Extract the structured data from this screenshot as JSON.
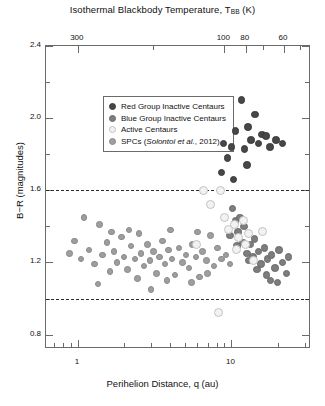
{
  "chart_data": {
    "type": "scatter",
    "title_main": "Isothermal Blackbody Temperature, T",
    "title_sub": "BB",
    "title_unit": " (K)",
    "xlabel": "Perihelion Distance, q (au)",
    "ylabel": "B−R (magnitudes)",
    "xscale": "log",
    "xlim": [
      0.62,
      33.0
    ],
    "ylim": [
      0.72,
      2.4
    ],
    "grid": false,
    "legend_position": "top-left-inside",
    "x_ticks": [
      {
        "value": 1,
        "label": "1"
      },
      {
        "value": 10,
        "label": "10"
      }
    ],
    "y_ticks": [
      {
        "value": 0.8,
        "label": "0.8"
      },
      {
        "value": 1.2,
        "label": "1.2"
      },
      {
        "value": 1.6,
        "label": "1.6"
      },
      {
        "value": 2.0,
        "label": "2.0"
      },
      {
        "value": 2.4,
        "label": "2.4"
      }
    ],
    "y_minor_ticks": [
      1.0,
      1.4,
      1.8,
      2.2
    ],
    "top_axis": {
      "label": "Isothermal Blackbody Temperature, T_BB (K)",
      "ticks": [
        {
          "q": 1.0,
          "label": "300"
        },
        {
          "q": 3.1,
          "label": ""
        },
        {
          "q": 9.0,
          "label": "100"
        },
        {
          "q": 12.4,
          "label": "80"
        },
        {
          "q": 16.0,
          "label": ""
        },
        {
          "q": 22.0,
          "label": "60"
        },
        {
          "q": 28.0,
          "label": ""
        }
      ]
    },
    "reference_lines": [
      {
        "y": 1.6,
        "style": "dashed",
        "color": "#2b2b2b"
      },
      {
        "y": 1.0,
        "style": "dashed",
        "color": "#2b2b2b"
      }
    ],
    "legend": [
      {
        "label": "Red Group Inactive Centaurs",
        "color": "#474747",
        "series": "red_group"
      },
      {
        "label": "Blue Group Inactive Centaurs",
        "color": "#7d7d7d",
        "series": "blue_group"
      },
      {
        "label": "Active Centaurs",
        "color": "#f2f2f2",
        "series": "active"
      },
      {
        "label_prefix": "SPCs (",
        "label_italic": "Solontoi et al.",
        "label_suffix": ", 2012)",
        "label": "SPCs (Solontoi et al., 2012)",
        "color": "#9e9e9e",
        "series": "spc"
      }
    ],
    "series": [
      {
        "name": "Red Group Inactive Centaurs",
        "color": "#474747",
        "marker": "filled-circle",
        "points": [
          [
            8.9,
            1.86
          ],
          [
            9.4,
            1.78
          ],
          [
            10.0,
            1.84
          ],
          [
            10.6,
            1.93
          ],
          [
            11.6,
            2.1
          ],
          [
            12.2,
            1.83
          ],
          [
            12.8,
            1.95
          ],
          [
            13.4,
            1.88
          ],
          [
            14.3,
            2.02
          ],
          [
            15.0,
            1.86
          ],
          [
            15.8,
            1.91
          ],
          [
            16.8,
            1.9
          ],
          [
            17.8,
            1.84
          ],
          [
            19.5,
            1.88
          ],
          [
            21.5,
            1.86
          ],
          [
            8.6,
            1.7
          ],
          [
            10.3,
            1.66
          ],
          [
            12.6,
            1.74
          ]
        ]
      },
      {
        "name": "Blue Group Inactive Centaurs",
        "color": "#7d7d7d",
        "marker": "filled-circle",
        "points": [
          [
            10.2,
            1.5
          ],
          [
            10.6,
            1.43
          ],
          [
            11.0,
            1.37
          ],
          [
            10.9,
            1.29
          ],
          [
            11.9,
            1.31
          ],
          [
            12.6,
            1.25
          ],
          [
            13.3,
            1.3
          ],
          [
            12.9,
            1.21
          ],
          [
            14.1,
            1.33
          ],
          [
            13.8,
            1.23
          ],
          [
            15.0,
            1.26
          ],
          [
            15.6,
            1.19
          ],
          [
            16.4,
            1.28
          ],
          [
            17.2,
            1.22
          ],
          [
            16.9,
            1.13
          ],
          [
            18.3,
            1.24
          ],
          [
            19.2,
            1.17
          ],
          [
            20.4,
            1.27
          ],
          [
            21.6,
            1.2
          ],
          [
            22.8,
            1.14
          ],
          [
            9.8,
            1.35
          ],
          [
            11.4,
            1.45
          ],
          [
            12.1,
            1.4
          ],
          [
            14.7,
            1.16
          ],
          [
            18.0,
            1.1
          ],
          [
            20.0,
            1.09
          ],
          [
            23.5,
            1.23
          ]
        ]
      },
      {
        "name": "Active Centaurs",
        "color": "#f2f2f2",
        "marker": "open-circle",
        "points": [
          [
            6.6,
            1.6
          ],
          [
            8.5,
            1.6
          ],
          [
            7.3,
            1.52
          ],
          [
            9.0,
            1.45
          ],
          [
            9.6,
            1.38
          ],
          [
            10.4,
            1.41
          ],
          [
            11.2,
            1.34
          ],
          [
            12.0,
            1.43
          ],
          [
            13.0,
            1.36
          ],
          [
            5.9,
            1.3
          ],
          [
            10.8,
            1.27
          ],
          [
            12.4,
            1.3
          ],
          [
            8.2,
            0.92
          ],
          [
            14.0,
            1.21
          ],
          [
            16.0,
            1.37
          ]
        ]
      },
      {
        "name": "SPCs (Solontoi et al., 2012)",
        "color": "#9e9e9e",
        "marker": "filled-circle",
        "points": [
          [
            0.95,
            1.32
          ],
          [
            1.05,
            1.22
          ],
          [
            1.18,
            1.27
          ],
          [
            1.28,
            1.19
          ],
          [
            1.38,
            1.41
          ],
          [
            1.45,
            1.24
          ],
          [
            1.55,
            1.31
          ],
          [
            1.62,
            1.15
          ],
          [
            1.72,
            1.26
          ],
          [
            1.8,
            1.2
          ],
          [
            1.92,
            1.34
          ],
          [
            2.0,
            1.23
          ],
          [
            2.1,
            1.16
          ],
          [
            2.22,
            1.29
          ],
          [
            2.35,
            1.22
          ],
          [
            2.45,
            1.11
          ],
          [
            2.58,
            1.25
          ],
          [
            2.7,
            1.18
          ],
          [
            2.85,
            1.3
          ],
          [
            2.95,
            1.21
          ],
          [
            3.1,
            1.26
          ],
          [
            3.25,
            1.14
          ],
          [
            3.4,
            1.23
          ],
          [
            3.55,
            1.32
          ],
          [
            3.7,
            1.19
          ],
          [
            3.9,
            1.27
          ],
          [
            4.1,
            1.22
          ],
          [
            4.3,
            1.13
          ],
          [
            4.55,
            1.28
          ],
          [
            4.8,
            1.2
          ],
          [
            5.05,
            1.24
          ],
          [
            5.3,
            1.17
          ],
          [
            5.6,
            1.3
          ],
          [
            5.9,
            1.23
          ],
          [
            6.2,
            1.12
          ],
          [
            6.5,
            1.26
          ],
          [
            6.9,
            1.21
          ],
          [
            7.3,
            1.35
          ],
          [
            7.7,
            1.18
          ],
          [
            8.1,
            1.28
          ],
          [
            8.6,
            1.22
          ],
          [
            1.1,
            1.45
          ],
          [
            1.35,
            1.08
          ],
          [
            2.15,
            1.38
          ],
          [
            3.0,
            1.05
          ],
          [
            4.0,
            1.38
          ],
          [
            5.5,
            1.09
          ],
          [
            7.0,
            1.14
          ],
          [
            2.5,
            1.36
          ],
          [
            3.8,
            1.1
          ],
          [
            6.0,
            1.37
          ],
          [
            1.65,
            1.37
          ],
          [
            0.88,
            1.25
          ],
          [
            9.2,
            1.24
          ],
          [
            9.8,
            1.19
          ]
        ]
      }
    ]
  }
}
